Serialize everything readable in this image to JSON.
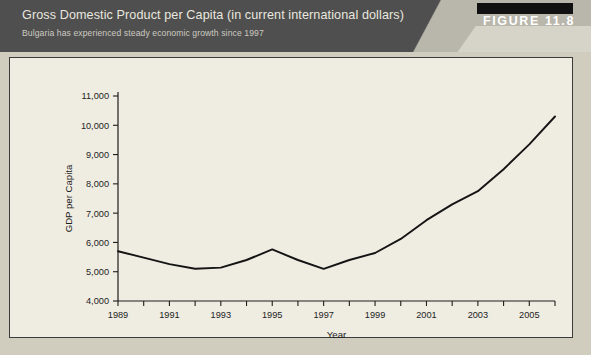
{
  "banner": {
    "title": "Gross Domestic Product per Capita (in current international dollars)",
    "subtitle": "Bulgaria has experienced steady economic growth since 1997",
    "figure_label": "FIGURE 11.8",
    "background_color": "#4f4f4f",
    "wedge_color": "#b9b6ab",
    "black_bar_color": "#111111",
    "title_color": "#e9e7df"
  },
  "panel": {
    "background_color": "#efece2",
    "border_color": "#3b3b3b"
  },
  "chart_data": {
    "type": "line",
    "title": "",
    "xlabel": "Year",
    "ylabel": "GDP per Capita",
    "xlim": [
      1989,
      2006
    ],
    "ylim": [
      4000,
      11000
    ],
    "grid": false,
    "legend": null,
    "line_color": "#141414",
    "y_ticks": [
      4000,
      5000,
      6000,
      7000,
      8000,
      9000,
      10000,
      11000
    ],
    "y_tick_labels": [
      "4,000",
      "5,000",
      "6,000",
      "7,000",
      "8,000",
      "9,000",
      "10,000",
      "11,000"
    ],
    "x_ticks": [
      1989,
      1990,
      1991,
      1992,
      1993,
      1994,
      1995,
      1996,
      1997,
      1998,
      1999,
      2000,
      2001,
      2002,
      2003,
      2004,
      2005,
      2006
    ],
    "x_tick_labels": [
      "1989",
      "",
      "1991",
      "",
      "1993",
      "",
      "1995",
      "",
      "1997",
      "",
      "1999",
      "",
      "2001",
      "",
      "2003",
      "",
      "2005",
      ""
    ],
    "x": [
      1989,
      1990,
      1991,
      1992,
      1993,
      1994,
      1995,
      1996,
      1997,
      1998,
      1999,
      2000,
      2001,
      2002,
      2003,
      2004,
      2005,
      2006
    ],
    "values": [
      5700,
      5480,
      5260,
      5100,
      5140,
      5400,
      5760,
      5400,
      5100,
      5400,
      5640,
      6120,
      6760,
      7300,
      7750,
      8500,
      9350,
      10300
    ],
    "series": [
      {
        "name": "GDP per Capita",
        "values": [
          5700,
          5480,
          5260,
          5100,
          5140,
          5400,
          5760,
          5400,
          5100,
          5400,
          5640,
          6120,
          6760,
          7300,
          7750,
          8500,
          9350,
          10300
        ]
      }
    ]
  }
}
